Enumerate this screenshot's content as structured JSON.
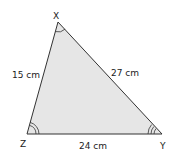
{
  "diagram": {
    "vertices": {
      "X": "X",
      "Y": "Y",
      "Z": "Z"
    },
    "sides": {
      "XZ": "15 cm",
      "XY": "27 cm",
      "ZY": "24 cm"
    },
    "angle_marks": {
      "X": 1,
      "Z": 2,
      "Y": 3
    },
    "colors": {
      "fill": "#e6e6e6",
      "stroke": "#333333"
    }
  }
}
